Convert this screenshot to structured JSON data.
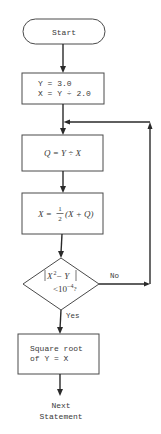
{
  "diagram": {
    "type": "flowchart",
    "nodes": {
      "start": {
        "shape": "terminal",
        "label": "Start"
      },
      "init": {
        "shape": "process",
        "line1": "Y = 3.0",
        "line2": "X = Y ÷ 2.0"
      },
      "quotient": {
        "shape": "process",
        "label": "Q = Y ÷ X"
      },
      "update": {
        "shape": "process",
        "lhs": "X =",
        "frac_num": "1",
        "frac_den": "2",
        "rhs": "(X + Q)"
      },
      "decision": {
        "shape": "decision",
        "line1_abs": "|X² − Y|",
        "line1_base": "X",
        "line1_exp": "2",
        "line1_rest": " − Y",
        "line2_prefix": "<10",
        "line2_exp": "−4",
        "line2_suffix": "?"
      },
      "result": {
        "shape": "process",
        "line1": "Square root",
        "line2": "of Y = X"
      },
      "next": {
        "shape": "text",
        "line1": "Next",
        "line2": "Statement"
      }
    },
    "edges": {
      "no_label": "No",
      "yes_label": "Yes"
    },
    "colors": {
      "stroke": "#4a4a4a",
      "line": "#2a2a2a",
      "text": "#3a3a3a",
      "background": "#ffffff"
    }
  }
}
